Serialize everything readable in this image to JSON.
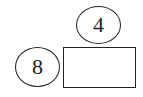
{
  "diagram": {
    "top_ellipse": {
      "label": "4"
    },
    "left_ellipse": {
      "label": "8"
    },
    "rectangle": {
      "label": ""
    }
  }
}
